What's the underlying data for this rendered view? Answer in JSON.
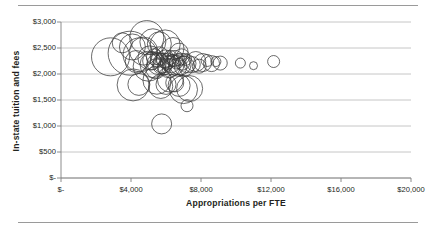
{
  "figure": {
    "name": "bubble-scatter-appropriations-vs-tuition",
    "background": "#ffffff",
    "rule_color": "#9a9a9a",
    "marker_color": "#3a3a3a",
    "gridline_color": "#b7b7b7",
    "axis_color": "#808080"
  },
  "chart_data": {
    "type": "scatter",
    "title": "",
    "subtitle": "",
    "xlabel": "Appropriations per FTE",
    "ylabel": "In-state tuition and fees",
    "xlim": [
      0,
      20000
    ],
    "ylim": [
      0,
      3000
    ],
    "xticks": [
      0,
      4000,
      8000,
      12000,
      16000,
      20000
    ],
    "yticks": [
      0,
      500,
      1000,
      1500,
      2000,
      2500,
      3000
    ],
    "xticklabels": [
      "$-",
      "$4,000",
      "$8,000",
      "$12,000",
      "$16,000",
      "$20,000"
    ],
    "yticklabels": [
      "$-",
      "$500",
      "$1,000",
      "$1,500",
      "$2,000",
      "$2,500",
      "$3,000"
    ],
    "grid": "horizontal",
    "legend": "none",
    "marker_style": "open-circle",
    "size_encodes": "enrollment",
    "series": [
      {
        "name": "Institutions",
        "points": [
          {
            "x": 2830,
            "y": 2330,
            "r": 19
          },
          {
            "x": 3950,
            "y": 2400,
            "r": 22
          },
          {
            "x": 4080,
            "y": 2520,
            "r": 13
          },
          {
            "x": 4300,
            "y": 2240,
            "r": 11
          },
          {
            "x": 3500,
            "y": 2600,
            "r": 10
          },
          {
            "x": 4520,
            "y": 2370,
            "r": 17
          },
          {
            "x": 4720,
            "y": 2440,
            "r": 14
          },
          {
            "x": 4120,
            "y": 1790,
            "r": 16
          },
          {
            "x": 4450,
            "y": 1800,
            "r": 11
          },
          {
            "x": 4980,
            "y": 2150,
            "r": 15
          },
          {
            "x": 5080,
            "y": 2310,
            "r": 12
          },
          {
            "x": 5180,
            "y": 2250,
            "r": 9
          },
          {
            "x": 5260,
            "y": 2180,
            "r": 13
          },
          {
            "x": 5340,
            "y": 2330,
            "r": 8
          },
          {
            "x": 5420,
            "y": 2100,
            "r": 10
          },
          {
            "x": 5500,
            "y": 2260,
            "r": 7
          },
          {
            "x": 5560,
            "y": 2200,
            "r": 11
          },
          {
            "x": 5620,
            "y": 2350,
            "r": 9
          },
          {
            "x": 5700,
            "y": 2160,
            "r": 8
          },
          {
            "x": 5760,
            "y": 2280,
            "r": 6
          },
          {
            "x": 5830,
            "y": 2210,
            "r": 10
          },
          {
            "x": 5900,
            "y": 2120,
            "r": 7
          },
          {
            "x": 5960,
            "y": 2290,
            "r": 9
          },
          {
            "x": 6030,
            "y": 2190,
            "r": 6
          },
          {
            "x": 6100,
            "y": 2250,
            "r": 8
          },
          {
            "x": 6170,
            "y": 2140,
            "r": 11
          },
          {
            "x": 6240,
            "y": 2320,
            "r": 7
          },
          {
            "x": 6310,
            "y": 2200,
            "r": 9
          },
          {
            "x": 6380,
            "y": 2260,
            "r": 6
          },
          {
            "x": 6450,
            "y": 2170,
            "r": 10
          },
          {
            "x": 6520,
            "y": 2300,
            "r": 8
          },
          {
            "x": 6600,
            "y": 2230,
            "r": 7
          },
          {
            "x": 6670,
            "y": 2130,
            "r": 9
          },
          {
            "x": 6740,
            "y": 2270,
            "r": 6
          },
          {
            "x": 6810,
            "y": 2190,
            "r": 11
          },
          {
            "x": 6890,
            "y": 2330,
            "r": 8
          },
          {
            "x": 6960,
            "y": 2210,
            "r": 7
          },
          {
            "x": 7040,
            "y": 2150,
            "r": 10
          },
          {
            "x": 7120,
            "y": 2280,
            "r": 6
          },
          {
            "x": 7200,
            "y": 2200,
            "r": 9
          },
          {
            "x": 5620,
            "y": 2580,
            "r": 12
          },
          {
            "x": 5950,
            "y": 2560,
            "r": 15
          },
          {
            "x": 6400,
            "y": 2490,
            "r": 11
          },
          {
            "x": 6750,
            "y": 2420,
            "r": 9
          },
          {
            "x": 4900,
            "y": 2700,
            "r": 17
          },
          {
            "x": 5250,
            "y": 2620,
            "r": 13
          },
          {
            "x": 5480,
            "y": 1880,
            "r": 14
          },
          {
            "x": 5700,
            "y": 1760,
            "r": 12
          },
          {
            "x": 6000,
            "y": 1800,
            "r": 10
          },
          {
            "x": 6250,
            "y": 1900,
            "r": 13
          },
          {
            "x": 6500,
            "y": 1830,
            "r": 9
          },
          {
            "x": 6750,
            "y": 1780,
            "r": 11
          },
          {
            "x": 7000,
            "y": 1700,
            "r": 14
          },
          {
            "x": 7350,
            "y": 1720,
            "r": 13
          },
          {
            "x": 7200,
            "y": 1390,
            "r": 6
          },
          {
            "x": 5750,
            "y": 1040,
            "r": 10
          },
          {
            "x": 7500,
            "y": 2180,
            "r": 8
          },
          {
            "x": 7700,
            "y": 2240,
            "r": 10
          },
          {
            "x": 7900,
            "y": 2150,
            "r": 7
          },
          {
            "x": 8100,
            "y": 2220,
            "r": 9
          },
          {
            "x": 8350,
            "y": 2260,
            "r": 6
          },
          {
            "x": 8600,
            "y": 2200,
            "r": 8
          },
          {
            "x": 8850,
            "y": 2240,
            "r": 5
          },
          {
            "x": 9100,
            "y": 2210,
            "r": 7
          },
          {
            "x": 10250,
            "y": 2210,
            "r": 5
          },
          {
            "x": 11000,
            "y": 2160,
            "r": 4
          },
          {
            "x": 12150,
            "y": 2240,
            "r": 6
          }
        ]
      }
    ]
  }
}
